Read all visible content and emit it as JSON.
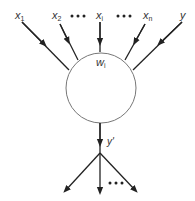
{
  "diagram": {
    "type": "neuron",
    "inputs": [
      {
        "label": "x",
        "sub": "1"
      },
      {
        "label": "x",
        "sub": "2"
      },
      {
        "label": "x",
        "sub": "i"
      },
      {
        "label": "x",
        "sub": "n"
      },
      {
        "label": "y",
        "sub": ""
      }
    ],
    "ellipsis": "•••",
    "node": {
      "label": "w",
      "sub": "i"
    },
    "output": {
      "label": "y'"
    },
    "colors": {
      "line": "#222222",
      "circle": "#777777",
      "text": "#333333"
    }
  }
}
